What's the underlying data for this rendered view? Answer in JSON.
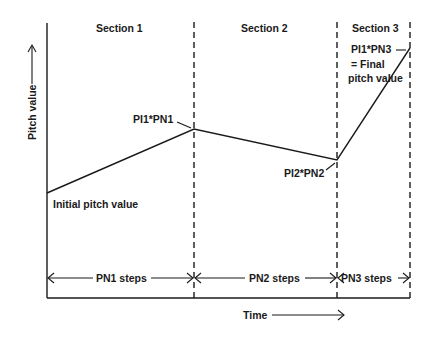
{
  "diagram": {
    "sections": [
      {
        "label": "Section 1"
      },
      {
        "label": "Section 2"
      },
      {
        "label": "Section 3"
      }
    ],
    "axes": {
      "y_label": "Pitch value",
      "x_label": "Time"
    },
    "points": {
      "start": "Initial pitch value",
      "p1": "PI1*PN1",
      "p2": "PI2*PN2",
      "p3_line1": "PI1*PN3",
      "p3_line2": "= Final",
      "p3_line3": "pitch value"
    },
    "spans": [
      {
        "label": "PN1 steps"
      },
      {
        "label": "PN2 steps"
      },
      {
        "label": "PN3 steps"
      }
    ]
  }
}
